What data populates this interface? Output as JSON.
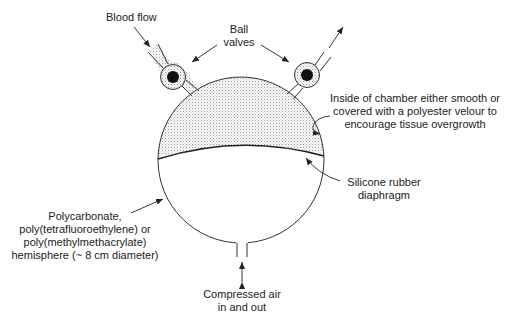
{
  "labels": {
    "blood_flow": "Blood flow",
    "ball_valves": [
      "Ball",
      "valves"
    ],
    "chamber_inside": [
      "Inside of chamber either smooth or",
      "covered with a polyester velour to",
      "encourage tissue overgrowth"
    ],
    "diaphragm": [
      "Silicone rubber",
      "diaphragm"
    ],
    "hemisphere": [
      "Polycarbonate,",
      "poly(tetrafluoroethylene) or",
      "poly(methylmethacrylate)",
      "hemisphere (~ 8 cm diameter)"
    ],
    "compressed_air": [
      "Compressed air",
      "in and out"
    ]
  },
  "colors": {
    "line": "#333333",
    "stipple": "#d8d8d8",
    "ball": "#111111"
  }
}
